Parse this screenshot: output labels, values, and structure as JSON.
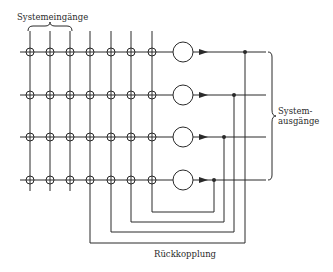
{
  "labels": {
    "inputs": "Systemeingänge",
    "outputs_line1": "System-",
    "outputs_line2": "ausgänge",
    "feedback": "Rückkopplung"
  },
  "diagram": {
    "type": "recurrent neural network (crossbar)",
    "input_columns": 3,
    "feedback_columns": 4,
    "neurons": 4,
    "columns_x": [
      30,
      50,
      70,
      90,
      111,
      131,
      152
    ],
    "rows_y": [
      52,
      95,
      137,
      180
    ],
    "neuron_x": 183,
    "tap_x": [
      245,
      234,
      224,
      214
    ],
    "feedback_bottom_y": [
      243,
      232,
      222,
      212
    ],
    "colors": {
      "line": "#2a2a2a",
      "background": "#ffffff"
    }
  }
}
